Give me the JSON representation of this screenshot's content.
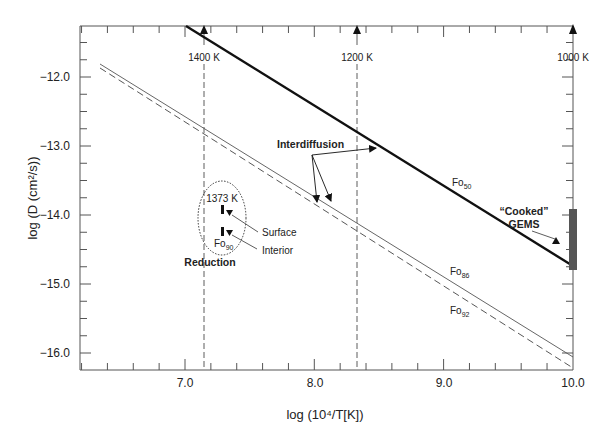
{
  "chart_data": {
    "type": "line",
    "title": "",
    "xlabel": "log (10⁴/T[K])",
    "ylabel": "log (D (cm²/s))",
    "xlim": [
      6.2,
      10.0
    ],
    "ylim": [
      -16.25,
      -11.26
    ],
    "x_ticks": [
      "7.0",
      "8.0",
      "9.0",
      "10.0"
    ],
    "y_ticks": [
      "−12.0",
      "−13.0",
      "−14.0",
      "−15.0",
      "−16.0"
    ],
    "grid": false,
    "legend": "none (inline labels)",
    "series": [
      {
        "name": "Fo50",
        "label_main": "Fo",
        "label_sub": "50",
        "style": "thick solid",
        "x": [
          7.0,
          10.0
        ],
        "y": [
          -11.26,
          -14.74
        ]
      },
      {
        "name": "Fo86",
        "label_main": "Fo",
        "label_sub": "86",
        "style": "thin solid",
        "x": [
          6.35,
          10.0
        ],
        "y": [
          -11.78,
          -16.02
        ]
      },
      {
        "name": "Fo92",
        "label_main": "Fo",
        "label_sub": "92",
        "style": "dashed",
        "x": [
          6.35,
          10.0
        ],
        "y": [
          -11.85,
          -16.18
        ]
      }
    ],
    "temperature_markers": [
      {
        "label": "1400 K",
        "x": 7.14
      },
      {
        "label": "1200 K",
        "x": 8.33
      },
      {
        "label": "1000 K",
        "x": 10.0
      }
    ],
    "reduction_data": {
      "temperature_label": "1373 K",
      "composition_main": "Fo",
      "composition_sub": "90",
      "points": [
        {
          "name": "Surface",
          "x": 7.29,
          "y": -13.93
        },
        {
          "name": "Interior",
          "x": 7.29,
          "y": -14.21
        }
      ]
    },
    "cooked_gems": {
      "x": 10.0,
      "y_range": [
        -14.77,
        -13.9
      ]
    },
    "annotations": {
      "interdiffusion": "Interdiffusion",
      "reduction": "Reduction",
      "surface": "Surface",
      "interior": "Interior",
      "cooked_gems_line1": "“Cooked”",
      "cooked_gems_line2": "GEMS"
    }
  }
}
